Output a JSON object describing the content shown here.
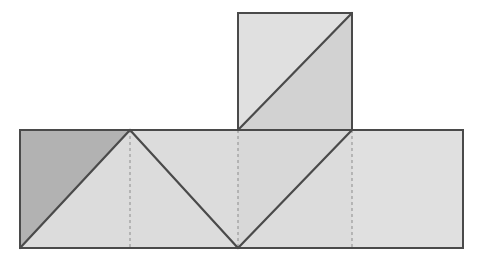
{
  "figure": {
    "background_color": "#ffffff",
    "canvas": {
      "width": 479,
      "height": 265
    }
  },
  "style": {
    "outline_color": "#4a4a4a",
    "outline_width": 2,
    "fold_line_color": "#8c8c8c",
    "fold_line_width": 1,
    "fold_line_dash": "3,3",
    "interior_line_color": "#4a4a4a",
    "interior_line_width": 2.2,
    "fill_dark": "#b2b2b2",
    "fill_mid": "#cfcfcf",
    "fill_light": "#dcdcdc",
    "fill_lighter": "#e2e2e2"
  },
  "geometry": {
    "main_band": {
      "x_left": 20,
      "x_right": 463,
      "y_top": 130,
      "y_bottom": 248
    },
    "top_square": {
      "x_left": 238,
      "x_right": 352,
      "y_top": 13,
      "y_bottom": 130
    },
    "fold_x_positions": [
      130,
      238,
      352
    ],
    "fold_y_position": 130,
    "peak_vertex": {
      "x": 130,
      "y": 130
    },
    "valley_vertex": {
      "x": 238,
      "y": 248
    }
  },
  "faces": [
    {
      "id": "face-upper-left-dark-triangle",
      "label": "Upper-left dark triangle",
      "points": "20,130 130,130 20,248",
      "fill": "#b2b2b2"
    },
    {
      "id": "face-lower-left-light-triangle",
      "label": "Lower-left light triangle",
      "points": "20,248 130,130 130,248",
      "fill": "#dcdcdc"
    },
    {
      "id": "face-second-cell-left-triangle",
      "label": "Second cell left triangle",
      "points": "130,130 238,248 130,248",
      "fill": "#dcdcdc"
    },
    {
      "id": "face-second-cell-upper-wedge",
      "label": "Second cell upper wedge",
      "points": "130,130 238,130 238,248",
      "fill": "#dcdcdc"
    },
    {
      "id": "face-third-cell-upper-triangle",
      "label": "Third cell upper-left triangle",
      "points": "238,130 352,130 238,248",
      "fill": "#d8d8d8"
    },
    {
      "id": "face-third-cell-lower-triangle",
      "label": "Third cell lower-right triangle",
      "points": "238,248 352,130 352,248",
      "fill": "#dcdcdc"
    },
    {
      "id": "face-right-cell-rectangle",
      "label": "Right cell rectangle",
      "points": "352,130 463,130 463,248 352,248",
      "fill": "#e0e0e0"
    },
    {
      "id": "face-top-square-upper-left-triangle",
      "label": "Top square upper-left triangle",
      "points": "238,13 352,13 238,130",
      "fill": "#e0e0e0"
    },
    {
      "id": "face-top-square-lower-right-triangle",
      "label": "Top square lower-right triangle",
      "points": "238,130 352,13 352,130",
      "fill": "#d2d2d2"
    }
  ],
  "fold_lines": [
    {
      "id": "fold-vertical-left",
      "label": "Left vertical fold line",
      "x1": 130,
      "y1": 130,
      "x2": 130,
      "y2": 248
    },
    {
      "id": "fold-vertical-middle",
      "label": "Middle vertical fold line",
      "x1": 238,
      "y1": 130,
      "x2": 238,
      "y2": 248
    },
    {
      "id": "fold-vertical-right",
      "label": "Right vertical fold line",
      "x1": 352,
      "y1": 130,
      "x2": 352,
      "y2": 248
    },
    {
      "id": "fold-horizontal-square-base",
      "label": "Horizontal fold line under the top square",
      "x1": 238,
      "y1": 130,
      "x2": 352,
      "y2": 130
    }
  ],
  "interior_lines": [
    {
      "id": "edge-left-diagonal",
      "label": "Left cell diagonal",
      "x1": 20,
      "y1": 248,
      "x2": 130,
      "y2": 130
    },
    {
      "id": "edge-second-cell-diagonal",
      "label": "Second cell diagonal",
      "x1": 130,
      "y1": 130,
      "x2": 238,
      "y2": 248
    },
    {
      "id": "edge-third-cell-diagonal",
      "label": "Third cell diagonal",
      "x1": 238,
      "y1": 248,
      "x2": 352,
      "y2": 130
    },
    {
      "id": "edge-top-square-diagonal",
      "label": "Top square diagonal",
      "x1": 238,
      "y1": 130,
      "x2": 352,
      "y2": 13
    }
  ],
  "outlines": [
    {
      "id": "outline-main-band",
      "label": "Outline of the main horizontal band",
      "points": "20,130 238,130 238,130 352,130 463,130 463,248 20,248"
    },
    {
      "id": "outline-top-square",
      "label": "Outline of the top square",
      "points": "238,130 238,13 352,13 352,130"
    }
  ]
}
